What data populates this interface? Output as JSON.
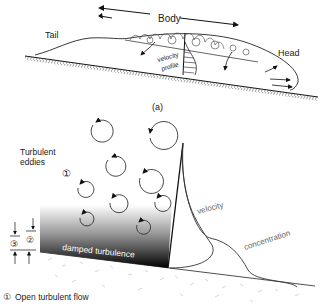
{
  "figure_a": {
    "labels": {
      "body": "Body",
      "tail": "Tail",
      "head": "Head",
      "velocity_profile_line1": "velocity",
      "velocity_profile_line2": "profile",
      "caption": "(a)"
    }
  },
  "figure_b": {
    "labels": {
      "turbulent_line1": "Turbulent",
      "turbulent_line2": "eddies",
      "zone1_marker": "①",
      "zone2_marker": "②",
      "zone3_marker": "③",
      "damped": "damped turbulence",
      "velocity": "velocity",
      "concentration": "concentration"
    },
    "legend": [
      {
        "marker": "①",
        "text": "Open turbulent flow"
      }
    ]
  }
}
